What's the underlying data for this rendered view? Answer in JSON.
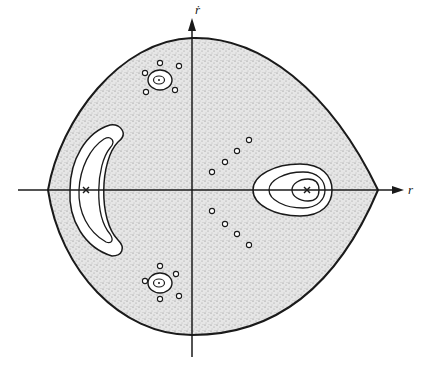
{
  "figure": {
    "type": "phase-space-diagram",
    "axes": {
      "horizontal_label": "r",
      "vertical_label": "ṙ"
    },
    "elements": {
      "outer_boundary": "shaded chaotic region enclosed by separatrix",
      "islands": [
        {
          "name": "right-island",
          "contours": 3,
          "center_marker": "x"
        },
        {
          "name": "left-crescent-island",
          "contours": 2,
          "center_marker": "x"
        },
        {
          "name": "upper-island",
          "contours": 2,
          "center_marker": "dot",
          "satellite_circles": 5
        },
        {
          "name": "lower-island",
          "contours": 2,
          "center_marker": "dot",
          "satellite_circles": 5
        }
      ],
      "chain_circles": {
        "upper": 4,
        "lower": 4
      }
    },
    "colors": {
      "ink": "#1a1a1a",
      "shading": "#9a9a9a",
      "background": "#ffffff"
    }
  }
}
